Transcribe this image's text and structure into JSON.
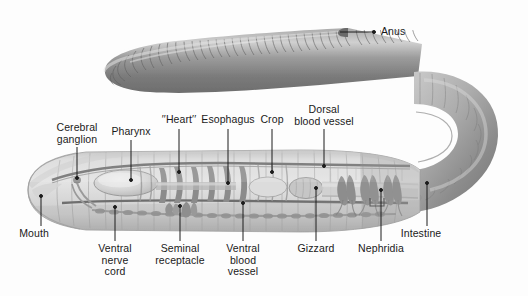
{
  "figure": {
    "background_color": "#fdfdfd",
    "text_color": "#1a1a1a",
    "leader_color": "#1c1c1c",
    "body_color_outer": "#8f8f8f",
    "body_color_inner": "#c9c9c9",
    "organ_color": "#8a8a8a",
    "vessel_color": "#6f6f6f"
  },
  "labels": [
    {
      "id": "anus",
      "text": "Anus",
      "lines": [
        "Anus"
      ],
      "x": 381,
      "y": 26,
      "align": "left",
      "leader": {
        "type": "horizontal",
        "x1": 340,
        "y1": 32,
        "x2": 374,
        "y2": 32
      }
    },
    {
      "id": "cerebral-ganglion",
      "text": "Cerebral ganglion",
      "lines": [
        "Cerebral",
        "ganglion"
      ],
      "x": 77,
      "y": 122,
      "align": "center",
      "leader": {
        "type": "vertical",
        "x1": 77,
        "y1": 147,
        "x2": 77,
        "y2": 178
      }
    },
    {
      "id": "pharynx",
      "text": "Pharynx",
      "lines": [
        "Pharynx"
      ],
      "x": 131,
      "y": 126,
      "align": "center",
      "leader": {
        "type": "vertical",
        "x1": 131,
        "y1": 140,
        "x2": 131,
        "y2": 180
      }
    },
    {
      "id": "heart",
      "text": "′′Heart′′",
      "lines": [
        "′′Heart′′"
      ],
      "x": 179,
      "y": 114,
      "align": "center",
      "leader": {
        "type": "vertical",
        "x1": 179,
        "y1": 129,
        "x2": 179,
        "y2": 172
      }
    },
    {
      "id": "esophagus",
      "text": "Esophagus",
      "lines": [
        "Esophagus"
      ],
      "x": 228,
      "y": 114,
      "align": "center",
      "leader": {
        "type": "vertical",
        "x1": 228,
        "y1": 129,
        "x2": 228,
        "y2": 183
      }
    },
    {
      "id": "crop",
      "text": "Crop",
      "lines": [
        "Crop"
      ],
      "x": 272,
      "y": 114,
      "align": "center",
      "leader": {
        "type": "vertical",
        "x1": 272,
        "y1": 129,
        "x2": 272,
        "y2": 172
      }
    },
    {
      "id": "dorsal-blood-vessel",
      "text": "Dorsal blood vessel",
      "lines": [
        "Dorsal",
        "blood vessel"
      ],
      "x": 324,
      "y": 104,
      "align": "center",
      "leader": {
        "type": "vertical",
        "x1": 324,
        "y1": 129,
        "x2": 324,
        "y2": 166
      }
    },
    {
      "id": "mouth",
      "text": "Mouth",
      "lines": [
        "Mouth"
      ],
      "x": 34,
      "y": 228,
      "align": "center",
      "leader": {
        "type": "vertical",
        "x1": 41,
        "y1": 226,
        "x2": 41,
        "y2": 196
      }
    },
    {
      "id": "ventral-nerve-cord",
      "text": "Ventral nerve cord",
      "lines": [
        "Ventral",
        "nerve",
        "cord"
      ],
      "x": 115,
      "y": 243,
      "align": "center",
      "leader": {
        "type": "vertical",
        "x1": 115,
        "y1": 241,
        "x2": 115,
        "y2": 207
      }
    },
    {
      "id": "seminal-receptacle",
      "text": "Seminal receptacle",
      "lines": [
        "Seminal",
        "receptacle"
      ],
      "x": 180,
      "y": 243,
      "align": "center",
      "leader": {
        "type": "vertical",
        "x1": 180,
        "y1": 241,
        "x2": 180,
        "y2": 206
      }
    },
    {
      "id": "ventral-blood-vessel",
      "text": "Ventral blood vessel",
      "lines": [
        "Ventral",
        "blood",
        "vessel"
      ],
      "x": 243,
      "y": 243,
      "align": "center",
      "leader": {
        "type": "vertical",
        "x1": 243,
        "y1": 241,
        "x2": 243,
        "y2": 203
      }
    },
    {
      "id": "gizzard",
      "text": "Gizzard",
      "lines": [
        "Gizzard"
      ],
      "x": 316,
      "y": 243,
      "align": "center",
      "leader": {
        "type": "vertical",
        "x1": 316,
        "y1": 241,
        "x2": 316,
        "y2": 188
      }
    },
    {
      "id": "nephridia",
      "text": "Nephridia",
      "lines": [
        "Nephridia"
      ],
      "x": 381,
      "y": 243,
      "align": "center",
      "leader": {
        "type": "vertical",
        "x1": 381,
        "y1": 241,
        "x2": 381,
        "y2": 190
      }
    },
    {
      "id": "intestine",
      "text": "Intestine",
      "lines": [
        "Intestine"
      ],
      "x": 421,
      "y": 228,
      "align": "center",
      "leader": {
        "type": "vertical",
        "x1": 427,
        "y1": 226,
        "x2": 427,
        "y2": 183
      }
    }
  ]
}
